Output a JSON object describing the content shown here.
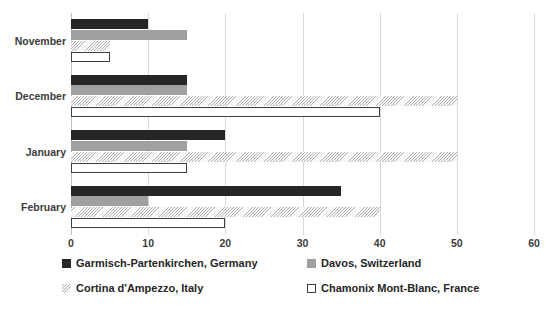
{
  "chart_data": {
    "type": "bar",
    "orientation": "horizontal",
    "title": "",
    "xlabel": "",
    "ylabel": "",
    "xlim": [
      0,
      60
    ],
    "xticks": [
      "0",
      "10",
      "20",
      "30",
      "40",
      "50",
      "60"
    ],
    "grid": true,
    "legend_position": "bottom",
    "categories": [
      "November",
      "December",
      "January",
      "February"
    ],
    "series": [
      {
        "name": "Garmisch-Partenkirchen, Germany",
        "pattern": "solid-dark",
        "color": "#262626",
        "values": [
          10,
          15,
          20,
          35
        ]
      },
      {
        "name": "Davos, Switzerland",
        "pattern": "dotted-light",
        "color": "#f2f2f2",
        "values": [
          15,
          15,
          15,
          10
        ]
      },
      {
        "name": "Cortina d'Ampezzo, Italy",
        "pattern": "diagonal-hatch",
        "color": "#f5f5f5",
        "values": [
          5,
          50,
          50,
          40
        ]
      },
      {
        "name": "Chamonix Mont-Blanc, France",
        "pattern": "outlined-white",
        "color": "#ffffff",
        "values": [
          5,
          40,
          15,
          20
        ]
      }
    ]
  }
}
